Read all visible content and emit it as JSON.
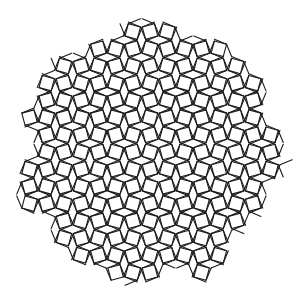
{
  "figure": {
    "caption_clipped": "",
    "tile_types": [
      "square",
      "triangle"
    ],
    "stroke_color": "#1a1a1a",
    "fill_color": "#ffffff",
    "background": "#ffffff",
    "center": [
      150,
      152
    ],
    "radius": 134,
    "edge_length": 12.6,
    "stroke_width": 1.1
  }
}
